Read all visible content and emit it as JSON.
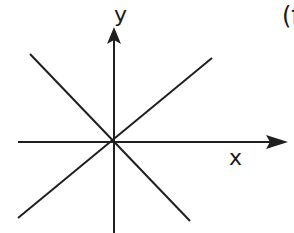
{
  "diagram": {
    "labels": {
      "y_axis": "y",
      "x_axis": "x",
      "panel_tag": "(f"
    },
    "colors": {
      "stroke": "#1f1f1f",
      "background": "#ffffff"
    },
    "elements": [
      {
        "type": "axis",
        "name": "x-axis",
        "direction": "horizontal",
        "arrow": "right"
      },
      {
        "type": "axis",
        "name": "y-axis",
        "direction": "vertical",
        "arrow": "up"
      },
      {
        "type": "line",
        "name": "positive-diagonal",
        "through_origin": true,
        "slope_sign": "positive"
      },
      {
        "type": "line",
        "name": "negative-diagonal",
        "through_origin": true,
        "slope_sign": "negative"
      }
    ]
  }
}
